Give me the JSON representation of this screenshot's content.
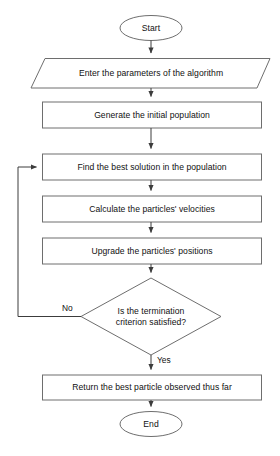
{
  "diagram": {
    "stroke_color": "#6e6e6e",
    "text_color": "#111111",
    "background_color": "#ffffff",
    "nodes": [
      {
        "id": "start",
        "type": "terminator",
        "label": "Start"
      },
      {
        "id": "input",
        "type": "io",
        "label": "Enter the parameters of the algorithm"
      },
      {
        "id": "init",
        "type": "process",
        "label": "Generate the initial population"
      },
      {
        "id": "findbest",
        "type": "process",
        "label": "Find the best solution in the population"
      },
      {
        "id": "velocities",
        "type": "process",
        "label": "Calculate the particles' velocities"
      },
      {
        "id": "positions",
        "type": "process",
        "label": "Upgrade the particles' positions"
      },
      {
        "id": "decision",
        "type": "decision",
        "label": "Is the termination\ncriterion satisfied?"
      },
      {
        "id": "return",
        "type": "process",
        "label": "Return the best particle observed thus far"
      },
      {
        "id": "end",
        "type": "terminator",
        "label": "End"
      }
    ],
    "edge_labels": {
      "no": "No",
      "yes": "Yes"
    },
    "bottom_caption": ""
  }
}
